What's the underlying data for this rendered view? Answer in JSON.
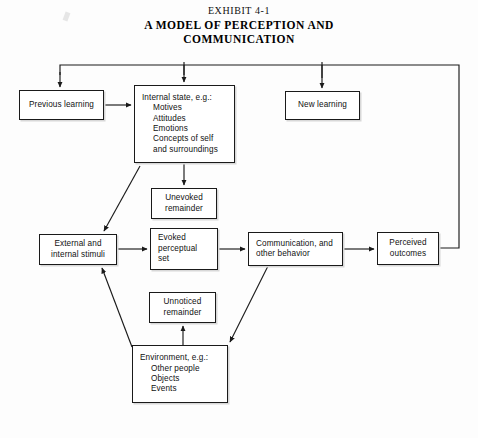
{
  "document": {
    "exhibit_label": "EXHIBIT 4-1",
    "title_line_1": "A MODEL OF PERCEPTION AND",
    "title_line_2": "COMMUNICATION"
  },
  "colors": {
    "ink": "#1a1a1a",
    "page": "#fdfdfd",
    "box_fill": "#ffffff",
    "shadow": "#d8d8d8"
  },
  "diagram": {
    "type": "flowchart",
    "nodes": [
      {
        "id": "previous-learning",
        "label": "Previous learning",
        "lines": [
          "Previous learning"
        ]
      },
      {
        "id": "internal-state",
        "label": "Internal state, e.g.:",
        "lines": [
          "Internal state, e.g.:",
          "Motives",
          "Attitudes",
          "Emotions",
          "Concepts of self",
          "and surroundings"
        ]
      },
      {
        "id": "new-learning",
        "label": "New learning",
        "lines": [
          "New learning"
        ]
      },
      {
        "id": "unevoked-remainder",
        "label": "Unevoked remainder",
        "lines": [
          "Unevoked",
          "remainder"
        ]
      },
      {
        "id": "external-internal-stimuli",
        "label": "External and internal stimuli",
        "lines": [
          "External and",
          "internal stimuli"
        ]
      },
      {
        "id": "evoked-perceptual-set",
        "label": "Evoked perceptual set",
        "lines": [
          "Evoked",
          "perceptual",
          "set"
        ]
      },
      {
        "id": "communication-and-other-behavior",
        "label": "Communication, and other behavior",
        "lines": [
          "Communication, and",
          "other behavior"
        ]
      },
      {
        "id": "perceived-outcomes",
        "label": "Perceived outcomes",
        "lines": [
          "Perceived",
          "outcomes"
        ]
      },
      {
        "id": "unnoticed-remainder",
        "label": "Unnoticed remainder",
        "lines": [
          "Unnoticed",
          "remainder"
        ]
      },
      {
        "id": "environment",
        "label": "Environment, e.g.:",
        "lines": [
          "Environment, e.g.:",
          "Other people",
          "Objects",
          "Events"
        ]
      }
    ],
    "edges": [
      {
        "from": "previous-learning",
        "to": "internal-state",
        "style": "straight-arrow"
      },
      {
        "from": "internal-state",
        "to": "unevoked-remainder",
        "style": "straight-arrow"
      },
      {
        "from": "internal-state",
        "to": "external-internal-stimuli",
        "style": "diagonal-arrow"
      },
      {
        "from": "external-internal-stimuli",
        "to": "evoked-perceptual-set",
        "style": "straight-arrow"
      },
      {
        "from": "evoked-perceptual-set",
        "to": "communication-and-other-behavior",
        "style": "straight-arrow"
      },
      {
        "from": "communication-and-other-behavior",
        "to": "perceived-outcomes",
        "style": "straight-arrow"
      },
      {
        "from": "communication-and-other-behavior",
        "to": "environment",
        "style": "diagonal-arrow"
      },
      {
        "from": "environment",
        "to": "unnoticed-remainder",
        "style": "straight-arrow"
      },
      {
        "from": "environment",
        "to": "external-internal-stimuli",
        "style": "diagonal-arrow"
      },
      {
        "from": "perceived-outcomes",
        "to": "previous-learning",
        "style": "feedback-loop"
      },
      {
        "from": "perceived-outcomes",
        "to": "internal-state",
        "style": "feedback-loop"
      },
      {
        "from": "perceived-outcomes",
        "to": "new-learning",
        "style": "feedback-loop"
      }
    ]
  }
}
